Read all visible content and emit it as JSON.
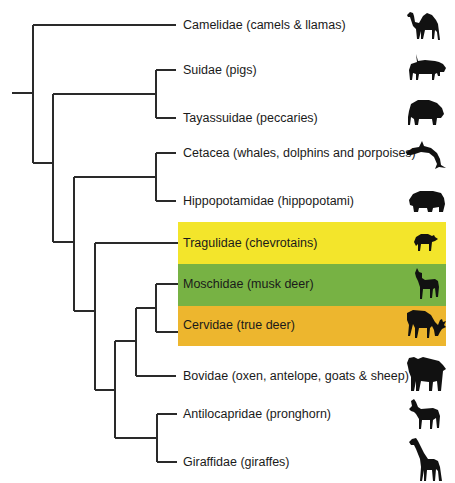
{
  "diagram": {
    "type": "phylogenetic-tree",
    "line_color": "#2a2a2a",
    "leaves": [
      {
        "label": "Camelidae (camels & llamas)",
        "animal": "camel-icon",
        "y": 25
      },
      {
        "label": "Suidae (pigs)",
        "animal": "warthog-icon",
        "y": 70
      },
      {
        "label": "Tayassuidae (peccaries)",
        "animal": "peccary-icon",
        "y": 118
      },
      {
        "label": "Cetacea (whales, dolphins and porpoises)",
        "animal": "dolphin-icon",
        "y": 153
      },
      {
        "label": "Hippopotamidae (hippopotami)",
        "animal": "hippo-icon",
        "y": 201
      },
      {
        "label": "Tragulidae (chevrotains)",
        "animal": "chevrotain-icon",
        "y": 243
      },
      {
        "label": "Moschidae (musk deer)",
        "animal": "musk-deer-icon",
        "y": 284
      },
      {
        "label": "Cervidae (true deer)",
        "animal": "deer-icon",
        "y": 325
      },
      {
        "label": "Bovidae (oxen, antelope, goats & sheep)",
        "animal": "buffalo-icon",
        "y": 376
      },
      {
        "label": "Antilocapridae (pronghorn)",
        "animal": "pronghorn-icon",
        "y": 414
      },
      {
        "label": "Giraffidae (giraffes)",
        "animal": "giraffe-icon",
        "y": 462
      }
    ],
    "highlights": [
      {
        "leaf": "Tragulidae (chevrotains)",
        "color": "#F3E52B",
        "top": 222,
        "height": 42
      },
      {
        "leaf": "Moschidae (musk deer)",
        "color": "#77B244",
        "top": 264,
        "height": 42
      },
      {
        "leaf": "Cervidae (true deer)",
        "color": "#EDB62E",
        "top": 306,
        "height": 40
      }
    ]
  }
}
